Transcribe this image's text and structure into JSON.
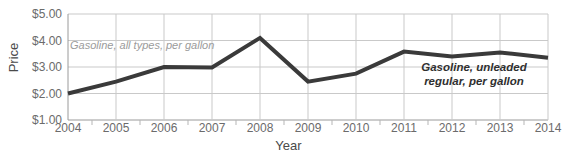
{
  "chart_data": {
    "type": "line",
    "title": "",
    "xlabel": "Year",
    "ylabel": "Price",
    "x": [
      2004,
      2005,
      2006,
      2007,
      2008,
      2009,
      2010,
      2011,
      2012,
      2013,
      2014
    ],
    "categories": [
      "2004",
      "2005",
      "2006",
      "2007",
      "2008",
      "2009",
      "2010",
      "2011",
      "2012",
      "2013",
      "2014"
    ],
    "values": [
      2.0,
      2.45,
      3.0,
      2.98,
      4.1,
      2.45,
      2.75,
      3.58,
      3.4,
      3.55,
      3.35
    ],
    "series": [
      {
        "name": "Gasoline, all types, per gallon",
        "values": [
          2.0,
          2.45,
          3.0,
          2.98,
          4.1,
          2.45,
          2.75,
          3.58,
          3.4,
          3.55,
          3.35
        ]
      }
    ],
    "ylim": [
      1.0,
      5.0
    ],
    "xlim": [
      2004,
      2014
    ],
    "ytick_labels": [
      "$1.00",
      "$2.00",
      "$3.00",
      "$4.00",
      "$5.00"
    ],
    "ytick_values": [
      1.0,
      2.0,
      3.0,
      4.0,
      5.0
    ],
    "grid": true,
    "legend_position": "inline-annotation",
    "annotations": [
      {
        "text": "Gasoline, all types, per gallon",
        "style": "light-italic",
        "color": "#9b9b9b"
      },
      {
        "text": "Gasoline, unleaded regular, per gallon",
        "line1": "Gasoline, unleaded",
        "line2": "regular, per gallon",
        "style": "bold-italic",
        "color": "#2f2f2f"
      }
    ],
    "line_color": "#3a3a3a",
    "grid_color": "#c9c9c9"
  }
}
